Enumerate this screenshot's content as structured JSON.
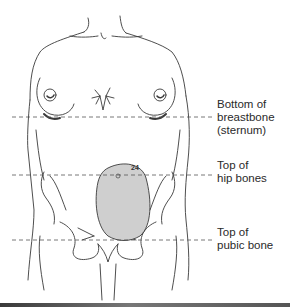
{
  "figure": {
    "uterus_week_marker": "24",
    "landmarks": [
      {
        "id": "sternum",
        "label": "Bottom of\nbreastbone\n(sternum)"
      },
      {
        "id": "hip",
        "label": "Top of\nhip bones"
      },
      {
        "id": "pubic",
        "label": "Top of\npubic bone"
      }
    ],
    "colors": {
      "line_art": "#3a3a3a",
      "uterus_fill": "#cfcfcf",
      "dashed_line": "#555555",
      "background": "#ffffff"
    }
  }
}
